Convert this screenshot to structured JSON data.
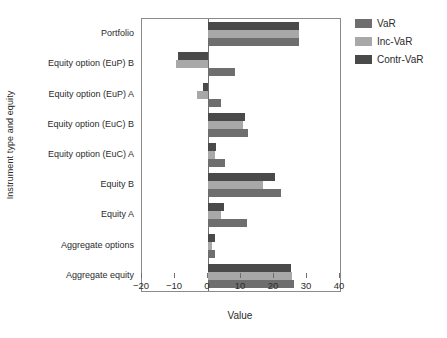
{
  "chart_data": {
    "type": "bar",
    "orientation": "horizontal",
    "title": "",
    "xlabel": "Value",
    "ylabel": "Instrument type and equity",
    "xlim": [
      -20,
      40
    ],
    "xticks": [
      -20,
      -10,
      0,
      10,
      20,
      30,
      40
    ],
    "xticklabels": [
      "−20",
      "−10",
      "0",
      "10",
      "20",
      "30",
      "40"
    ],
    "grid": false,
    "zero_reference_line": true,
    "legend_position": "upper right outside",
    "categories": [
      "Portfolio",
      "Equity option (EuP) B",
      "Equity option (EuP) A",
      "Equity option (EuC) B",
      "Equity option (EuC) A",
      "Equity B",
      "Equity A",
      "Aggregate options",
      "Aggregate equity"
    ],
    "series": [
      {
        "name": "VaR",
        "color": "#6e6e6e",
        "values": [
          27.6,
          8.3,
          3.8,
          12.0,
          5.0,
          22.0,
          11.7,
          2.2,
          26.0
        ]
      },
      {
        "name": "Inc-VaR",
        "color": "#a8a8a8",
        "values": [
          27.6,
          -9.6,
          -3.3,
          10.5,
          2.0,
          16.8,
          4.0,
          1.3,
          25.5
        ]
      },
      {
        "name": "Contr-VaR",
        "color": "#4a4a4a",
        "values": [
          27.6,
          -9.0,
          -1.6,
          11.3,
          2.5,
          20.3,
          4.8,
          2.2,
          25.2
        ]
      }
    ]
  },
  "axes": {
    "frame_color": "#8b8b8b",
    "text_color": "#2b2b2b"
  },
  "legend": {
    "items": [
      {
        "label": "VaR",
        "color": "#6e6e6e"
      },
      {
        "label": "Inc-VaR",
        "color": "#a8a8a8"
      },
      {
        "label": "Contr-VaR",
        "color": "#4a4a4a"
      }
    ]
  }
}
